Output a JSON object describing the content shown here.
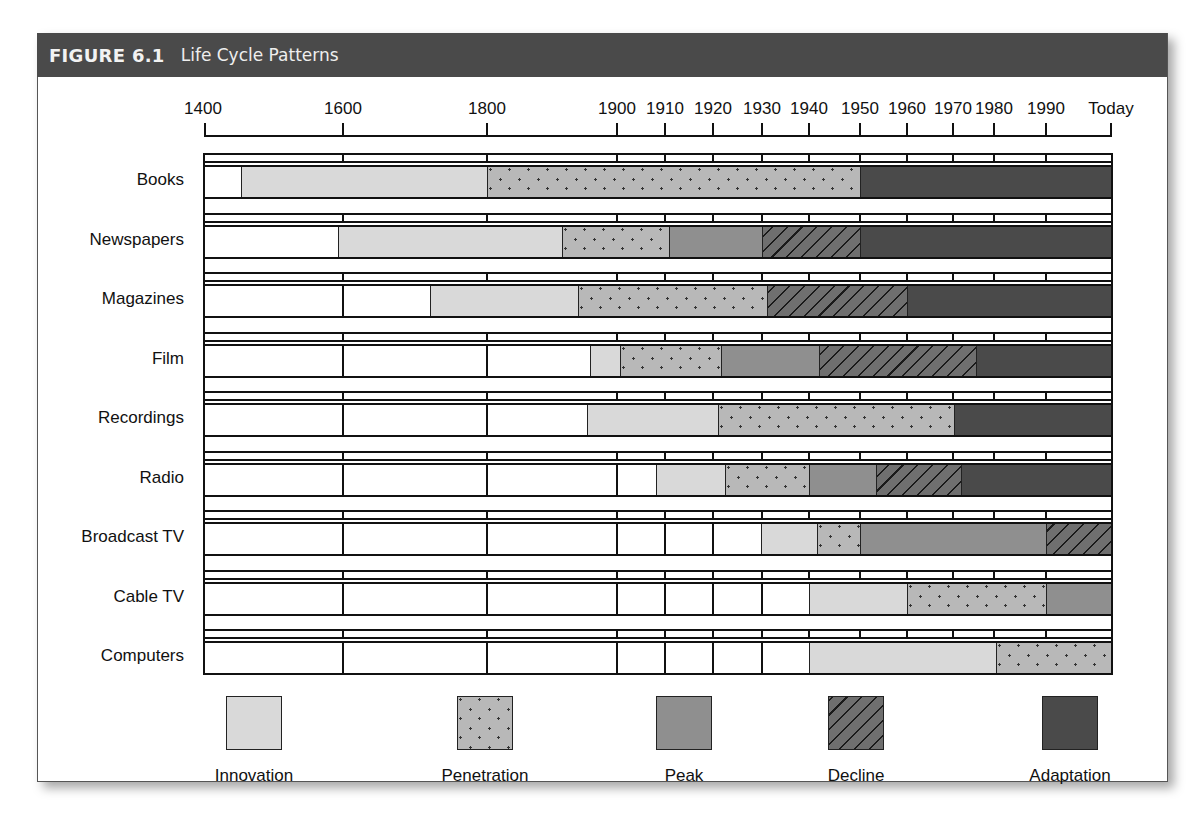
{
  "figure": {
    "number": "FIGURE 6.1",
    "title": "Life Cycle Patterns"
  },
  "colors": {
    "title_bar": "#4a4a4a",
    "innovation": "#d9d9d9",
    "penetration": "#b8b8b8",
    "peak": "#8f8f8f",
    "decline": "#6f6f6f",
    "adaptation": "#4a4a4a"
  },
  "axis": {
    "ticks": [
      {
        "label": "1400",
        "x": 205
      },
      {
        "label": "1600",
        "x": 343
      },
      {
        "label": "1800",
        "x": 487
      },
      {
        "label": "1900",
        "x": 617
      },
      {
        "label": "1910",
        "x": 665
      },
      {
        "label": "1920",
        "x": 713
      },
      {
        "label": "1930",
        "x": 762
      },
      {
        "label": "1940",
        "x": 809
      },
      {
        "label": "1950",
        "x": 860
      },
      {
        "label": "1960",
        "x": 907
      },
      {
        "label": "1970",
        "x": 953
      },
      {
        "label": "1980",
        "x": 994
      },
      {
        "label": "1990",
        "x": 1046
      },
      {
        "label": "Today",
        "x": 1111
      }
    ]
  },
  "legend": [
    {
      "key": "innovation",
      "label": "Innovation",
      "x": 254
    },
    {
      "key": "penetration",
      "label": "Penetration",
      "x": 485
    },
    {
      "key": "peak",
      "label": "Peak",
      "x": 684
    },
    {
      "key": "decline",
      "label": "Decline",
      "x": 856
    },
    {
      "key": "adaptation",
      "label": "Adaptation",
      "x": 1070
    }
  ],
  "chart_data": {
    "type": "bar",
    "subtype": "horizontal-timeline-stacked",
    "title": "FIGURE 6.1 Life Cycle Patterns",
    "xlabel": "",
    "ylabel": "",
    "x_tick_labels": [
      "1400",
      "1600",
      "1800",
      "1900",
      "1910",
      "1920",
      "1930",
      "1940",
      "1950",
      "1960",
      "1970",
      "1980",
      "1990",
      "Today"
    ],
    "categories": [
      "Books",
      "Newspapers",
      "Magazines",
      "Film",
      "Recordings",
      "Radio",
      "Broadcast TV",
      "Cable TV",
      "Computers"
    ],
    "legend": [
      "Innovation",
      "Penetration",
      "Peak",
      "Decline",
      "Adaptation"
    ],
    "legend_position": "bottom",
    "phases_approx_years": {
      "Books": {
        "Innovation": [
          1450,
          1800
        ],
        "Penetration": [
          1800,
          1950
        ],
        "Adaptation": [
          1950,
          "Today"
        ]
      },
      "Newspapers": {
        "Innovation": [
          1590,
          1890
        ],
        "Penetration": [
          1890,
          1910
        ],
        "Peak": [
          1910,
          1930
        ],
        "Decline": [
          1930,
          1950
        ],
        "Adaptation": [
          1950,
          "Today"
        ]
      },
      "Magazines": {
        "Innovation": [
          1720,
          1880
        ],
        "Penetration": [
          1880,
          1930
        ],
        "Decline": [
          1930,
          1960
        ],
        "Adaptation": [
          1960,
          "Today"
        ]
      },
      "Film": {
        "Innovation": [
          1895,
          1900
        ],
        "Penetration": [
          1900,
          1922
        ],
        "Peak": [
          1922,
          1942
        ],
        "Decline": [
          1942,
          1975
        ],
        "Adaptation": [
          1975,
          "Today"
        ]
      },
      "Recordings": {
        "Innovation": [
          1890,
          1920
        ],
        "Penetration": [
          1920,
          1970
        ],
        "Adaptation": [
          1970,
          "Today"
        ]
      },
      "Radio": {
        "Innovation": [
          1908,
          1922
        ],
        "Penetration": [
          1922,
          1940
        ],
        "Peak": [
          1940,
          1953
        ],
        "Decline": [
          1953,
          1972
        ],
        "Adaptation": [
          1972,
          "Today"
        ]
      },
      "Broadcast TV": {
        "Innovation": [
          1930,
          1941
        ],
        "Penetration": [
          1941,
          1950
        ],
        "Peak": [
          1950,
          1990
        ],
        "Decline": [
          1990,
          "Today"
        ]
      },
      "Cable TV": {
        "Innovation": [
          1940,
          1960
        ],
        "Penetration": [
          1960,
          1990
        ],
        "Peak": [
          1990,
          "Today"
        ]
      },
      "Computers": {
        "Innovation": [
          1940,
          1980
        ],
        "Penetration": [
          1980,
          "Today"
        ]
      }
    },
    "grid": true
  },
  "rows": [
    {
      "label": "Books",
      "top": 165,
      "segments": [
        {
          "phase": "blank",
          "x0": 205,
          "x1": 241
        },
        {
          "phase": "innovation",
          "x0": 241,
          "x1": 487
        },
        {
          "phase": "penetration",
          "x0": 487,
          "x1": 860
        },
        {
          "phase": "adaptation",
          "x0": 860,
          "x1": 1111
        }
      ]
    },
    {
      "label": "Newspapers",
      "top": 225,
      "segments": [
        {
          "phase": "blank",
          "x0": 205,
          "x1": 338
        },
        {
          "phase": "innovation",
          "x0": 338,
          "x1": 562
        },
        {
          "phase": "penetration",
          "x0": 562,
          "x1": 669
        },
        {
          "phase": "peak",
          "x0": 669,
          "x1": 762
        },
        {
          "phase": "decline",
          "x0": 762,
          "x1": 860
        },
        {
          "phase": "adaptation",
          "x0": 860,
          "x1": 1111
        }
      ]
    },
    {
      "label": "Magazines",
      "top": 284,
      "segments": [
        {
          "phase": "blank",
          "x0": 205,
          "x1": 430
        },
        {
          "phase": "innovation",
          "x0": 430,
          "x1": 578
        },
        {
          "phase": "penetration",
          "x0": 578,
          "x1": 767
        },
        {
          "phase": "decline",
          "x0": 767,
          "x1": 907
        },
        {
          "phase": "adaptation",
          "x0": 907,
          "x1": 1111
        }
      ]
    },
    {
      "label": "Film",
      "top": 344,
      "segments": [
        {
          "phase": "blank",
          "x0": 205,
          "x1": 590
        },
        {
          "phase": "innovation",
          "x0": 590,
          "x1": 620
        },
        {
          "phase": "penetration",
          "x0": 620,
          "x1": 721
        },
        {
          "phase": "peak",
          "x0": 721,
          "x1": 819
        },
        {
          "phase": "decline",
          "x0": 819,
          "x1": 976
        },
        {
          "phase": "adaptation",
          "x0": 976,
          "x1": 1111
        }
      ]
    },
    {
      "label": "Recordings",
      "top": 403,
      "segments": [
        {
          "phase": "blank",
          "x0": 205,
          "x1": 587
        },
        {
          "phase": "innovation",
          "x0": 587,
          "x1": 718
        },
        {
          "phase": "penetration",
          "x0": 718,
          "x1": 954
        },
        {
          "phase": "adaptation",
          "x0": 954,
          "x1": 1111
        }
      ]
    },
    {
      "label": "Radio",
      "top": 463,
      "segments": [
        {
          "phase": "blank",
          "x0": 205,
          "x1": 656
        },
        {
          "phase": "innovation",
          "x0": 656,
          "x1": 725
        },
        {
          "phase": "penetration",
          "x0": 725,
          "x1": 809
        },
        {
          "phase": "peak",
          "x0": 809,
          "x1": 876
        },
        {
          "phase": "decline",
          "x0": 876,
          "x1": 961
        },
        {
          "phase": "adaptation",
          "x0": 961,
          "x1": 1111
        }
      ]
    },
    {
      "label": "Broadcast TV",
      "top": 522,
      "segments": [
        {
          "phase": "blank",
          "x0": 205,
          "x1": 761
        },
        {
          "phase": "innovation",
          "x0": 761,
          "x1": 817
        },
        {
          "phase": "penetration",
          "x0": 817,
          "x1": 860
        },
        {
          "phase": "peak",
          "x0": 860,
          "x1": 1046
        },
        {
          "phase": "decline",
          "x0": 1046,
          "x1": 1111
        }
      ]
    },
    {
      "label": "Cable TV",
      "top": 582,
      "segments": [
        {
          "phase": "blank",
          "x0": 205,
          "x1": 809
        },
        {
          "phase": "innovation",
          "x0": 809,
          "x1": 907
        },
        {
          "phase": "penetration",
          "x0": 907,
          "x1": 1046
        },
        {
          "phase": "peak",
          "x0": 1046,
          "x1": 1111
        }
      ]
    },
    {
      "label": "Computers",
      "top": 641,
      "segments": [
        {
          "phase": "blank",
          "x0": 205,
          "x1": 809
        },
        {
          "phase": "innovation",
          "x0": 809,
          "x1": 996
        },
        {
          "phase": "penetration",
          "x0": 996,
          "x1": 1111
        }
      ]
    }
  ]
}
